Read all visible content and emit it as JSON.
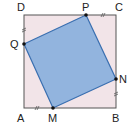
{
  "diagram": {
    "outer_square": {
      "vertices": {
        "A": [
          24,
          108
        ],
        "B": [
          116,
          108
        ],
        "C": [
          116,
          15
        ],
        "D": [
          24,
          15
        ]
      },
      "fill": "#f2e4e8",
      "stroke": "#555555"
    },
    "inner_square": {
      "vertices": {
        "P": [
          86,
          15
        ],
        "N": [
          116,
          79
        ],
        "M": [
          53,
          108
        ],
        "Q": [
          24,
          44
        ]
      },
      "fill": "#92b4de",
      "stroke": "#3a6fb0"
    },
    "labels": {
      "A": "A",
      "B": "B",
      "C": "C",
      "D": "D",
      "P": "P",
      "Q": "Q",
      "M": "M",
      "N": "N"
    },
    "tick_marks": [
      "DQ",
      "PC",
      "NB",
      "AM"
    ],
    "tick_symbol": "//"
  }
}
